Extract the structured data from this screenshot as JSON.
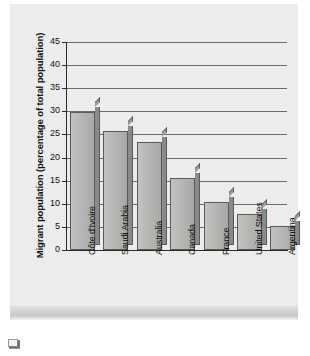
{
  "chart_data": {
    "type": "bar",
    "title": "",
    "xlabel": "",
    "ylabel": "Migrant population (percentage of total population)",
    "categories": [
      "Côte d'Ivoire",
      "Saudi Arabia",
      "Australia",
      "Canada",
      "France",
      "United States",
      "Argentina"
    ],
    "values": [
      29.8,
      25.8,
      23.3,
      15.5,
      10.4,
      7.9,
      5.1
    ],
    "ylim": [
      0,
      45
    ],
    "ytick_labels": [
      "0",
      "5",
      "10",
      "15",
      "20",
      "25",
      "30",
      "35",
      "40",
      "45"
    ],
    "ytick_values": [
      0,
      5,
      10,
      15,
      20,
      25,
      30,
      35,
      40,
      45
    ],
    "grid": "horizontal",
    "legend": "none",
    "style": "3d-bars-grayscale",
    "colors": {
      "bar_front": "#b6b6b5",
      "bar_side": "#8a8a89",
      "bar_outline": "#5a5a5a",
      "gridline": "#6a6a6a",
      "axis": "#2a2a2a",
      "panel_background": "#ececeb",
      "text": "#111111"
    }
  },
  "figure": {
    "y_axis_title": "Migrant population (percentage of total population)",
    "placeholder_icon_name": "broken-image-icon"
  }
}
